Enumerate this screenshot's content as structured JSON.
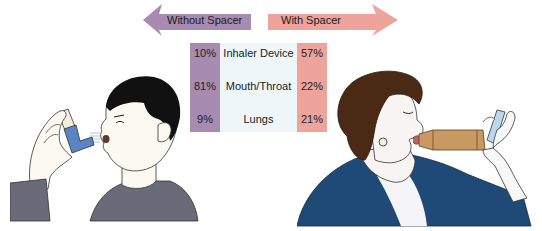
{
  "arrows": {
    "left": {
      "label": "Without Spacer",
      "color": "#a78bb0"
    },
    "right": {
      "label": "With Spacer",
      "color": "#eea39b"
    }
  },
  "table": {
    "rows": [
      {
        "without": "10%",
        "location": "Inhaler Device",
        "with": "57%"
      },
      {
        "without": "81%",
        "location": "Mouth/Throat",
        "with": "22%"
      },
      {
        "without": "9%",
        "location": "Lungs",
        "with": "21%"
      }
    ],
    "colors": {
      "without": "#a78bb0",
      "middle": "#eef6fa",
      "with": "#eea39b"
    }
  },
  "illustrations": {
    "left": "man-using-inhaler-without-spacer",
    "right": "woman-using-inhaler-with-spacer"
  }
}
